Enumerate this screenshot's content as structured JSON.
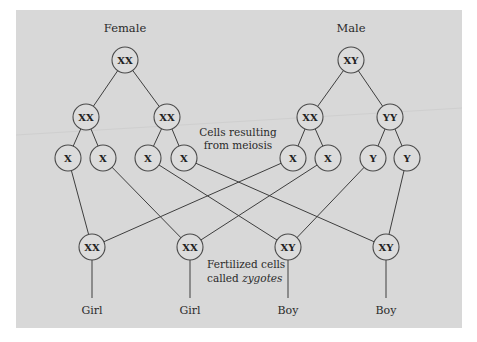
{
  "headers": {
    "female": "Female",
    "male": "Male"
  },
  "annotations": {
    "meiosis_line1": "Cells resulting",
    "meiosis_line2": "from meiosis",
    "zygote_line1": "Fertilized cells",
    "zygote_line2_prefix": "called ",
    "zygote_line2_italic": "zygotes"
  },
  "nodes": {
    "female_parent": "XX",
    "female_l2_left": "XX",
    "female_l2_right": "XX",
    "female_gametes": [
      "X",
      "X",
      "X",
      "X"
    ],
    "male_parent": "XY",
    "male_l2_left": "XX",
    "male_l2_right": "YY",
    "male_gametes": [
      "X",
      "X",
      "Y",
      "Y"
    ],
    "zygotes": [
      "XX",
      "XX",
      "XY",
      "XY"
    ]
  },
  "outcomes": [
    "Girl",
    "Girl",
    "Boy",
    "Boy"
  ],
  "colors": {
    "panel": "#d8d8d8",
    "node_fill": "#dcdcdc",
    "stroke": "#4a4a4a"
  }
}
